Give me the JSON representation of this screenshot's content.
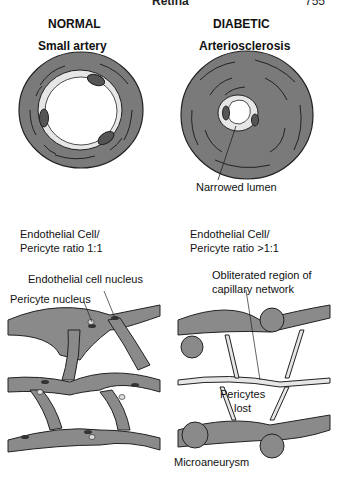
{
  "header": {
    "running_title": "Retina",
    "page_number": "755"
  },
  "top_panels": {
    "normal": {
      "heading": "NORMAL",
      "subheading": "Small artery"
    },
    "diabetic": {
      "heading": "DIABETIC",
      "subheading": "Arteriosclerosis",
      "callout": "Narrowed lumen"
    }
  },
  "bottom_panels": {
    "normal": {
      "ratio_line1": "Endothelial Cell/",
      "ratio_line2": "Pericyte ratio 1:1",
      "callouts": [
        "Endothelial cell nucleus",
        "Pericyte nucleus"
      ]
    },
    "diabetic": {
      "ratio_line1": "Endothelial Cell/",
      "ratio_line2": "Pericyte ratio >1:1",
      "callout_obliterated_1": "Obliterated region of",
      "callout_obliterated_2": "capillary network",
      "pericytes_1": "Pericytes",
      "pericytes_2": "lost",
      "microaneurysm": "Microaneurysm"
    }
  },
  "colors": {
    "vessel_wall": "#7a7a7a",
    "lumen": "#ffffff",
    "endothelium": "#e6e6e6",
    "nucleus": "#3a3a3a",
    "outline": "#222222"
  }
}
